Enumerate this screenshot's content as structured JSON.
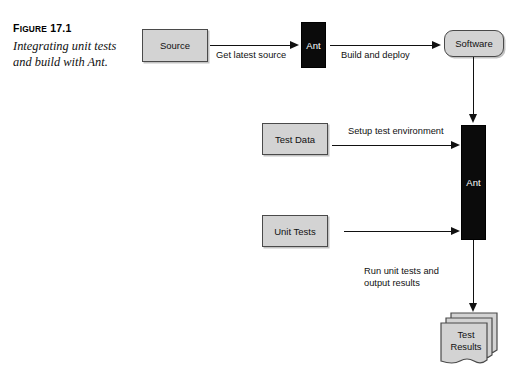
{
  "figure": {
    "label_prefix": "F",
    "label_rest": "IGURE",
    "label_number": "17.1",
    "caption": "Integrating unit tests and build with Ant."
  },
  "diagram": {
    "nodes": {
      "source": {
        "label": "Source",
        "shape": "rectangle",
        "fill": "#d3d3d3"
      },
      "ant_top": {
        "label": "Ant",
        "shape": "rectangle",
        "fill": "#0b0b0b"
      },
      "software": {
        "label": "Software",
        "shape": "rounded-rectangle",
        "fill": "#d3d3d3"
      },
      "test_data": {
        "label": "Test Data",
        "shape": "rectangle",
        "fill": "#d3d3d3"
      },
      "unit_tests": {
        "label": "Unit Tests",
        "shape": "rectangle",
        "fill": "#d3d3d3"
      },
      "ant_main": {
        "label": "Ant",
        "shape": "rectangle",
        "fill": "#0b0b0b"
      },
      "test_results": {
        "label": "Test\nResults",
        "shape": "document-stack",
        "fill": "#d3d3d3"
      }
    },
    "edges": {
      "get_latest_source": "Get latest source",
      "build_and_deploy": "Build and deploy",
      "setup_test_environment": "Setup test environment",
      "run_unit_tests": "Run unit tests and\noutput results"
    }
  },
  "colors": {
    "box_fill": "#d3d3d3",
    "box_border": "#4a4a4a",
    "black_fill": "#0b0b0b",
    "line": "#111111",
    "page_background": "#ffffff"
  }
}
